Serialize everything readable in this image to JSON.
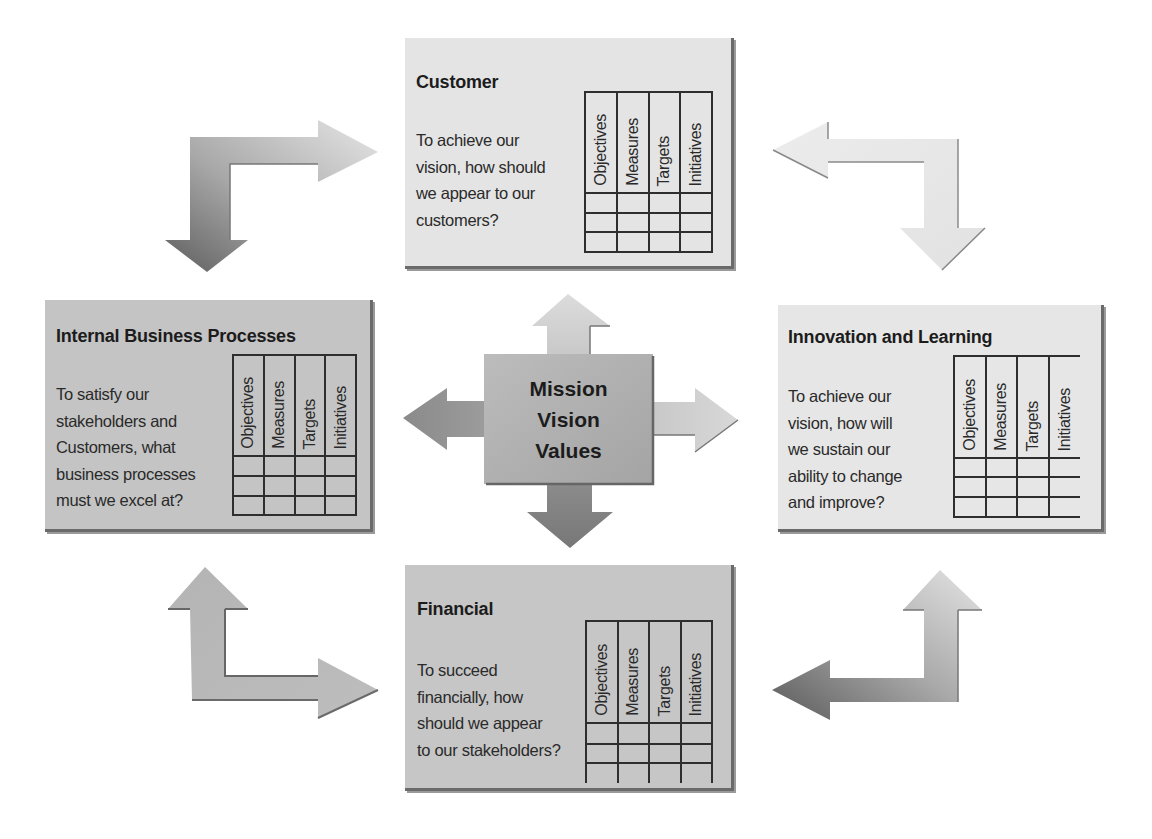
{
  "diagram": {
    "type": "balanced-scorecard",
    "center": {
      "lines": [
        "Mission",
        "Vision",
        "Values"
      ]
    },
    "table_columns": [
      "Objectives",
      "Measures",
      "Targets",
      "Initiatives"
    ],
    "table_empty_rows": 3,
    "perspectives": {
      "customer": {
        "title": "Customer",
        "question_lines": [
          "To achieve our",
          "vision, how should",
          "we appear to our",
          "customers?"
        ],
        "fill": "#e4e4e4"
      },
      "internal": {
        "title": "Internal Business Processes",
        "question_lines": [
          "To satisfy our",
          "stakeholders and",
          "Customers, what",
          "business processes",
          "must we excel at?"
        ],
        "fill": "#c4c4c4"
      },
      "innovation": {
        "title": "Innovation and Learning",
        "question_lines": [
          "To achieve our",
          "vision, how will",
          "we sustain our",
          "ability to change",
          "and improve?"
        ],
        "fill": "#e6e6e6"
      },
      "financial": {
        "title": "Financial",
        "question_lines": [
          "To succeed",
          "financially, how",
          "should we appear",
          "to our stakeholders?"
        ],
        "fill": "#c6c6c6"
      }
    },
    "connectors": [
      {
        "id": "top-left",
        "from": "customer",
        "to": "internal",
        "bidirectional": true
      },
      {
        "id": "top-right",
        "from": "customer",
        "to": "innovation",
        "bidirectional": true
      },
      {
        "id": "bottom-left",
        "from": "internal",
        "to": "financial",
        "bidirectional": true
      },
      {
        "id": "bottom-right",
        "from": "innovation",
        "to": "financial",
        "bidirectional": true
      },
      {
        "id": "center-up",
        "from": "center",
        "to": "customer"
      },
      {
        "id": "center-down",
        "from": "center",
        "to": "financial"
      },
      {
        "id": "center-left",
        "from": "center",
        "to": "internal"
      },
      {
        "id": "center-right",
        "from": "center",
        "to": "innovation"
      }
    ],
    "colors": {
      "background": "#ffffff",
      "box_shadow": "#6a6a6a",
      "grid_line": "#2e2e2e",
      "text": "#1e1e1e"
    }
  }
}
